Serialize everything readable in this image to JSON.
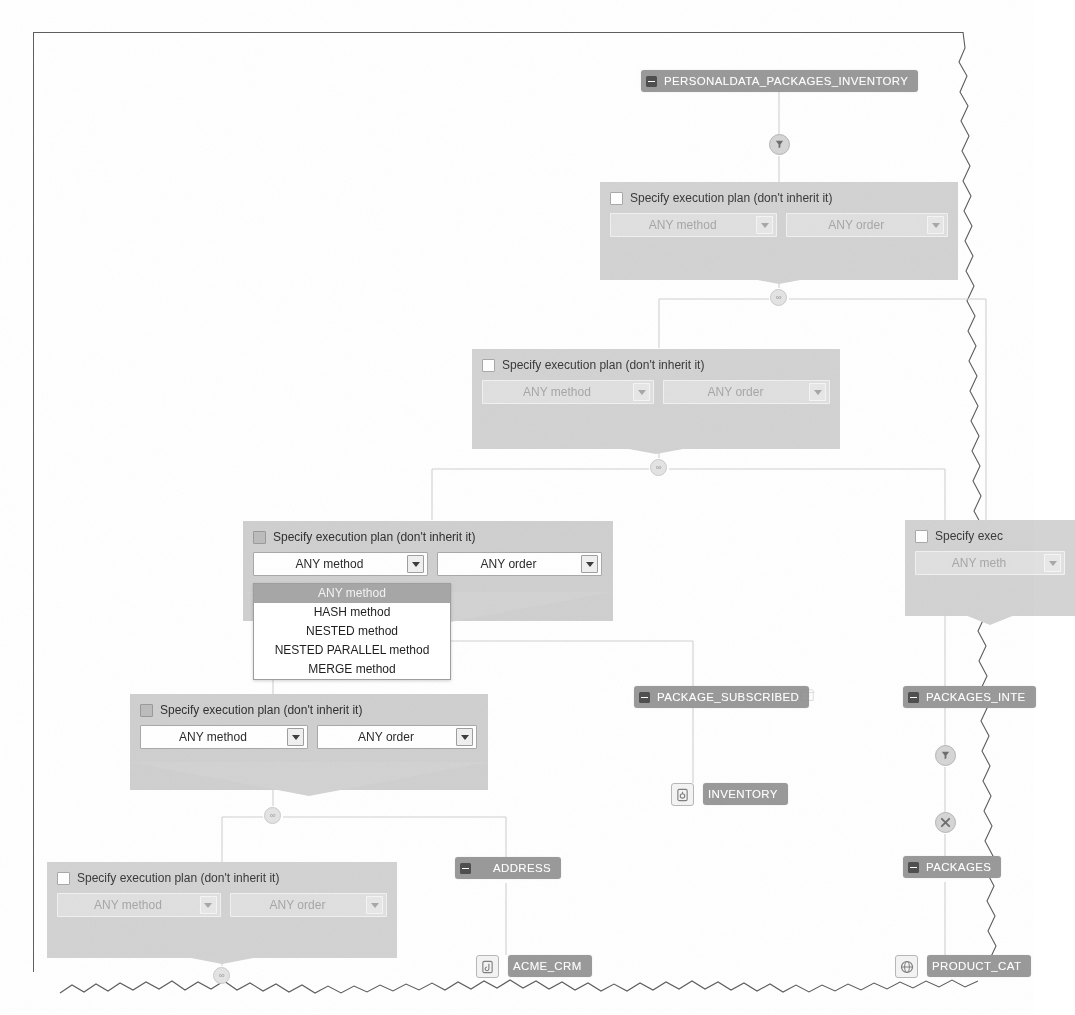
{
  "panels": [
    {
      "id": "panel-1",
      "checkbox_label": "Specify execution plan (don't inherit it)",
      "checked": false,
      "enabled": false,
      "method_value": "ANY method",
      "order_value": "ANY order"
    },
    {
      "id": "panel-2",
      "checkbox_label": "Specify execution plan (don't inherit it)",
      "checked": false,
      "enabled": false,
      "method_value": "ANY method",
      "order_value": "ANY order"
    },
    {
      "id": "panel-3",
      "checkbox_label": "Specify execution plan (don't inherit it)",
      "checked": true,
      "enabled": true,
      "method_value": "ANY method",
      "order_value": "ANY order"
    },
    {
      "id": "panel-4",
      "checkbox_label": "Specify execution plan (don't inherit it)",
      "checked": true,
      "enabled": true,
      "method_value": "ANY method",
      "order_value": "ANY order"
    },
    {
      "id": "panel-5",
      "checkbox_label": "Specify execution plan (don't inherit it)",
      "checked": false,
      "enabled": false,
      "method_value": "ANY method",
      "order_value": "ANY order"
    },
    {
      "id": "panel-6-clipped",
      "checkbox_label": "Specify exec",
      "checked": false,
      "enabled": false,
      "method_value": "ANY meth",
      "order_value": ""
    }
  ],
  "dropdown": {
    "open": true,
    "selected": "ANY method",
    "options": [
      "ANY method",
      "HASH method",
      "NESTED method",
      "NESTED PARALLEL method",
      "MERGE method"
    ]
  },
  "nodes": [
    {
      "id": "node-root",
      "label": "PERSONALDATA_PACKAGES_INVENTORY",
      "icon": "minus-box-icon"
    },
    {
      "id": "node-package-subscribed",
      "label": "PACKAGE_SUBSCRIBED",
      "icon": "minus-box-icon"
    },
    {
      "id": "node-packages-inte",
      "label": "PACKAGES_INTE",
      "icon": "minus-box-icon"
    },
    {
      "id": "node-address",
      "label": "ADDRESS",
      "icon": "minus-box-icon"
    },
    {
      "id": "node-packages",
      "label": "PACKAGES",
      "icon": "minus-box-icon"
    }
  ],
  "sources": [
    {
      "id": "source-inventory",
      "label": "INVENTORY",
      "icon": "database-icon"
    },
    {
      "id": "source-acme-crm",
      "label": "ACME_CRM",
      "icon": "database-icon"
    },
    {
      "id": "source-product-cat",
      "label": "PRODUCT_CAT",
      "icon": "globe-icon"
    }
  ],
  "badges": [
    {
      "id": "badge-root-filter",
      "glyph": "filter-icon"
    },
    {
      "id": "badge-join-1",
      "glyph": "join-icon"
    },
    {
      "id": "badge-join-2",
      "glyph": "join-icon"
    },
    {
      "id": "badge-join-3",
      "glyph": "join-icon"
    },
    {
      "id": "badge-join-4",
      "glyph": "join-icon"
    },
    {
      "id": "badge-join-5",
      "glyph": "join-icon"
    },
    {
      "id": "badge-packages-filter",
      "glyph": "filter-icon"
    },
    {
      "id": "badge-packages-cross",
      "glyph": "cross-icon"
    }
  ],
  "icons": {
    "minus_box": "minus-box-icon",
    "database": "database-icon",
    "globe": "globe-icon",
    "ghost_table": "table-outline-icon",
    "dropdown_arrow": "chevron-down-icon"
  },
  "colors": {
    "node_chip": "#9a9a9a",
    "panel": "#d3d3d3",
    "dropdown_selected": "#a6a6a6",
    "connector": "#cfcfcf",
    "frame": "#5e5e5e"
  }
}
